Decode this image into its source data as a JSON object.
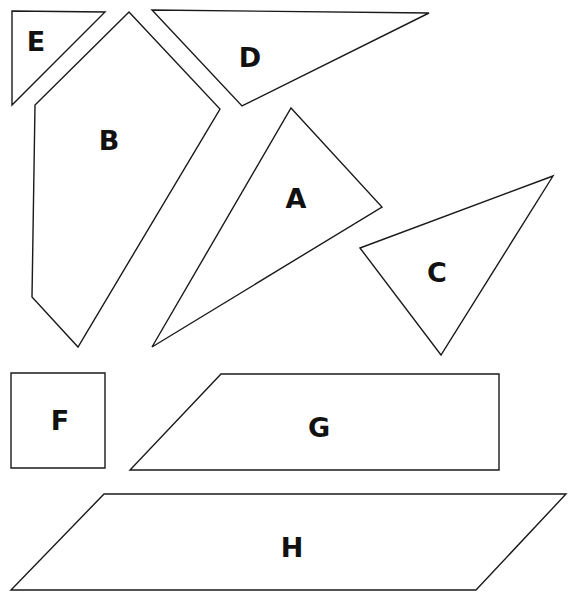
{
  "diagram": {
    "title": "",
    "stroke_color": "#1a1a1a",
    "fill_color": "#ffffff",
    "pieces": [
      {
        "label": "E",
        "shape": "triangle",
        "points": "12,11 105,12 12,105",
        "label_pos": [
          36,
          41
        ]
      },
      {
        "label": "B",
        "shape": "pentagon",
        "points": "129,12 220,109 78,347 32,297 35,105",
        "label_pos": [
          109,
          140
        ]
      },
      {
        "label": "D",
        "shape": "triangle",
        "points": "152,10 429,13 242,106",
        "label_pos": [
          250,
          57
        ]
      },
      {
        "label": "A",
        "shape": "triangle",
        "points": "291,108 382,207 152,347",
        "label_pos": [
          296,
          198
        ]
      },
      {
        "label": "C",
        "shape": "triangle",
        "points": "360,248 553,176 441,355",
        "label_pos": [
          437,
          272
        ]
      },
      {
        "label": "F",
        "shape": "square",
        "points": "11,373 105,373 105,468 11,468",
        "label_pos": [
          60,
          420
        ]
      },
      {
        "label": "G",
        "shape": "trapezoid",
        "points": "221,374 499,374 499,470 130,470",
        "label_pos": [
          319,
          427
        ]
      },
      {
        "label": "H",
        "shape": "parallelogram",
        "points": "104,494 566,494 476,590 11,590",
        "label_pos": [
          292,
          547
        ]
      }
    ]
  }
}
